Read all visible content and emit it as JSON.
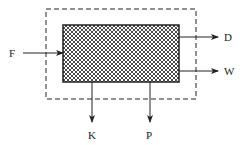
{
  "diagram": {
    "type": "process-block-diagram",
    "system_boundary": {
      "style": "dashed",
      "x": 46,
      "y": 9,
      "width": 150,
      "height": 90
    },
    "process_unit": {
      "fill": "crosshatch",
      "x": 63,
      "y": 25,
      "width": 116,
      "height": 57
    },
    "streams": [
      {
        "label": "F",
        "direction": "in",
        "side": "left"
      },
      {
        "label": "D",
        "direction": "out",
        "side": "right"
      },
      {
        "label": "W",
        "direction": "out",
        "side": "right"
      },
      {
        "label": "K",
        "direction": "out",
        "side": "bottom"
      },
      {
        "label": "P",
        "direction": "out",
        "side": "bottom"
      }
    ]
  },
  "labels": {
    "F": "F",
    "D": "D",
    "W": "W",
    "K": "K",
    "P": "P"
  },
  "colors": {
    "stroke": "#222222",
    "background": "#ffffff"
  }
}
